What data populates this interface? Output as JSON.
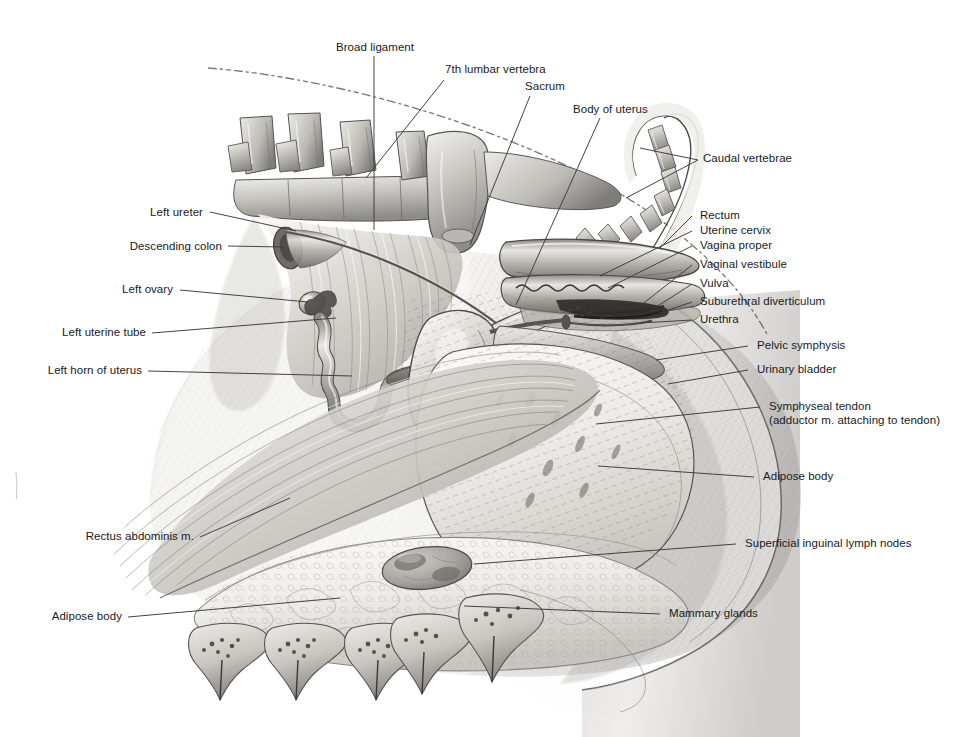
{
  "figure": {
    "background_color": "#ffffff",
    "ink_color": "#1a1a1a",
    "leader_color": "#3a3a3a",
    "width": 970,
    "height": 737
  },
  "labels": {
    "broad_ligament": "Broad ligament",
    "seventh_lumbar_vertebra": "7th lumbar vertebra",
    "sacrum": "Sacrum",
    "body_of_uterus": "Body of uterus",
    "caudal_vertebrae": "Caudal vertebrae",
    "left_ureter": "Left ureter",
    "descending_colon": "Descending colon",
    "left_ovary": "Left ovary",
    "left_uterine_tube": "Left uterine tube",
    "left_horn_of_uterus": "Left horn of uterus",
    "rectum": "Rectum",
    "uterine_cervix": "Uterine cervix",
    "vagina_proper": "Vagina proper",
    "vaginal_vestibule": "Vaginal vestibule",
    "vulva": "Vulva",
    "suburethral_diverticulum": "Suburethral diverticulum",
    "urethra": "Urethra",
    "pelvic_symphysis": "Pelvic symphysis",
    "urinary_bladder": "Urinary bladder",
    "symphyseal_tendon": "Symphyseal tendon",
    "symphyseal_tendon_note": "(adductor m. attaching to tendon)",
    "adipose_body_right": "Adipose body",
    "superficial_inguinal_lymph_nodes": "Superficial inguinal lymph nodes",
    "mammary_glands": "Mammary glands",
    "rectus_abdominis": "Rectus abdominis m.",
    "adipose_body_left": "Adipose body"
  }
}
